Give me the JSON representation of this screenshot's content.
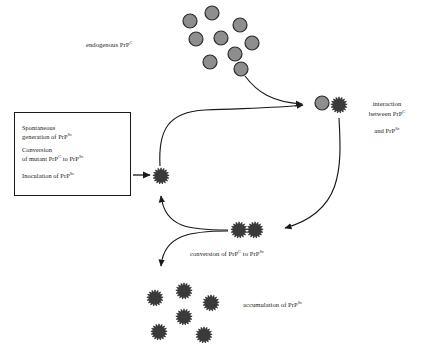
{
  "diagram": {
    "colors": {
      "prp_c_fill": "#8e8e8e",
      "prp_c_stroke": "#2b2b2b",
      "prp_sc_fill": "#3a3a3a",
      "prp_sc_stroke": "#2b2b2b",
      "arrow": "#1a1a1a",
      "text": "#1b1b1b",
      "box_border": "#1a1a1a",
      "background": "#ffffff"
    }
  },
  "origin_box": {
    "lines": [
      {
        "text": "Spontaneous",
        "text2": "generation of PrP",
        "sup2": "Sc"
      },
      {
        "text": "Conversion",
        "text2": "of mutant PrP",
        "sup2": "C",
        "text3": " to PrP",
        "sup3": "Sc"
      },
      {
        "text": "Inoculation of PrP",
        "sup": "Sc"
      }
    ],
    "line1_a": "Spontaneous",
    "line1_b": "generation of PrP",
    "line1_b_sup": "Sc",
    "line2_a": "Conversion",
    "line2_b": "of mutant PrP",
    "line2_b_sup": "C",
    "line2_c": " to PrP",
    "line2_c_sup": "Sc",
    "line3_a": "Inoculation of PrP",
    "line3_a_sup": "Sc"
  },
  "labels": {
    "endogenous": {
      "text": "endogenous PrP",
      "sup": "C"
    },
    "interaction": {
      "line1": "interaction",
      "line2": "between PrP",
      "line2_sup": "C",
      "line3": "and PrP",
      "line3_sup": "Sc"
    },
    "conversion": {
      "a": "conversion of PrP",
      "a_sup": "C",
      "b": " to PrP",
      "b_sup": "Sc"
    },
    "accumulation": {
      "text": "accumulation of PrP",
      "sup": "Sc"
    }
  },
  "particles": {
    "endogenous_prp_c": {
      "count": 9,
      "radius": 7,
      "positions": [
        {
          "x": 190,
          "y": 21
        },
        {
          "x": 212,
          "y": 13
        },
        {
          "x": 240,
          "y": 25
        },
        {
          "x": 196,
          "y": 39
        },
        {
          "x": 221,
          "y": 38
        },
        {
          "x": 252,
          "y": 43
        },
        {
          "x": 235,
          "y": 54
        },
        {
          "x": 210,
          "y": 62
        },
        {
          "x": 241,
          "y": 69
        }
      ]
    },
    "interaction_pair": {
      "prp_c": {
        "x": 322,
        "y": 103,
        "radius": 7
      },
      "prp_sc": {
        "x": 339,
        "y": 105,
        "radius": 8
      }
    },
    "seed_prp_sc": {
      "x": 161,
      "y": 176,
      "radius": 8
    },
    "conversion_pair": [
      {
        "x": 239,
        "y": 230,
        "radius": 8
      },
      {
        "x": 255,
        "y": 230,
        "radius": 8
      }
    ],
    "accumulation_prp_sc": {
      "count": 6,
      "positions": [
        {
          "x": 155,
          "y": 298,
          "radius": 8
        },
        {
          "x": 184,
          "y": 291,
          "radius": 8
        },
        {
          "x": 211,
          "y": 303,
          "radius": 8
        },
        {
          "x": 184,
          "y": 317,
          "radius": 8
        },
        {
          "x": 159,
          "y": 332,
          "radius": 8
        },
        {
          "x": 204,
          "y": 335,
          "radius": 8
        }
      ]
    }
  },
  "arrows": [
    {
      "name": "box-to-seed",
      "from": "origin-box",
      "to": "seed-prp-sc",
      "style": "straight-right"
    },
    {
      "name": "seed-to-interaction",
      "from": "seed-prp-sc",
      "to": "interaction-pair",
      "style": "curved-up-right"
    },
    {
      "name": "endogenous-to-interaction",
      "from": "endogenous-pool",
      "to": "interaction-pair",
      "style": "curved-down-right"
    },
    {
      "name": "interaction-to-conversion",
      "from": "interaction-pair",
      "to": "conversion-pair",
      "style": "curved-down-left"
    },
    {
      "name": "conversion-to-seed",
      "from": "conversion-pair",
      "to": "seed-prp-sc",
      "style": "curved-up-left"
    },
    {
      "name": "conversion-to-accumulation",
      "from": "conversion-pair",
      "to": "accumulation-cluster",
      "style": "curved-down-left"
    }
  ]
}
